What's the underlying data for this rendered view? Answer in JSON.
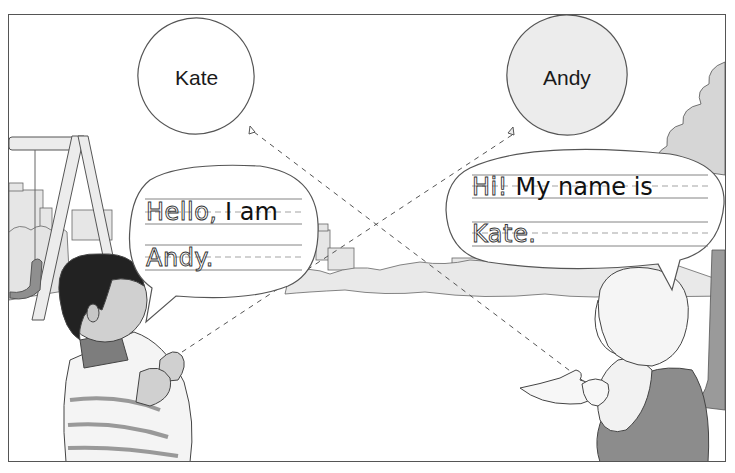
{
  "illustration": {
    "description": "Two children in a park holding balloons labeled with each other's names, with handwriting-practice speech bubbles",
    "balloons": [
      {
        "label": "Kate",
        "fill": "#ffffff"
      },
      {
        "label": "Andy",
        "fill": "#ececec"
      }
    ],
    "speech_bubbles": [
      {
        "speaker": "boy",
        "line1_traced": "Hello,",
        "line1_solid": " I am",
        "line2_traced": "Andy."
      },
      {
        "speaker": "girl",
        "line1_traced": "Hi!",
        "line1_solid": " My name is",
        "line2_traced": "Kate."
      }
    ],
    "colors": {
      "outline": "#555555",
      "ink": "#111111",
      "guide_line": "#777777",
      "dashed_guide": "#999999",
      "shade": "#cfcfcf",
      "dark_shade": "#8a8a8a"
    }
  }
}
